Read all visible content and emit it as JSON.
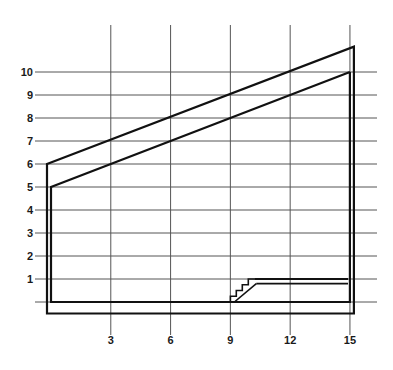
{
  "chart_data": {
    "type": "line",
    "title": "",
    "xlabel": "",
    "ylabel": "",
    "x_ticks": [
      3,
      6,
      9,
      12,
      15
    ],
    "y_ticks": [
      1,
      2,
      3,
      4,
      5,
      6,
      7,
      8,
      9,
      10
    ],
    "xlim": [
      -0.8,
      16.3
    ],
    "ylim": [
      -1.5,
      12.1
    ],
    "grid": true,
    "legend": "none",
    "series": [
      {
        "name": "outer-boundary",
        "closed": true,
        "points": [
          [
            -0.2,
            6
          ],
          [
            15.2,
            11.1
          ],
          [
            15.2,
            -0.5
          ],
          [
            -0.2,
            -0.5
          ]
        ]
      },
      {
        "name": "inner-boundary",
        "closed": false,
        "points": [
          [
            15,
            10
          ],
          [
            0,
            5
          ],
          [
            0,
            0
          ],
          [
            15,
            0
          ],
          [
            15,
            10
          ]
        ]
      },
      {
        "name": "upper-ledge",
        "closed": false,
        "points": [
          [
            10.2,
            1
          ],
          [
            14.9,
            1
          ]
        ]
      },
      {
        "name": "lower-ledge",
        "closed": false,
        "points": [
          [
            10.3,
            0.8
          ],
          [
            14.9,
            0.8
          ]
        ]
      },
      {
        "name": "staircase",
        "closed": false,
        "points": [
          [
            9,
            0
          ],
          [
            9,
            0.25
          ],
          [
            9.3,
            0.25
          ],
          [
            9.3,
            0.5
          ],
          [
            9.6,
            0.5
          ],
          [
            9.6,
            0.75
          ],
          [
            9.9,
            0.75
          ],
          [
            9.9,
            1
          ],
          [
            10.2,
            1
          ]
        ]
      },
      {
        "name": "staircase-ramp",
        "closed": false,
        "points": [
          [
            9.2,
            0
          ],
          [
            10.3,
            0.8
          ]
        ]
      }
    ]
  }
}
